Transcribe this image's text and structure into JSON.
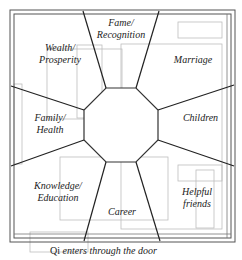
{
  "diagram": {
    "center_shape": "octagon",
    "areas": [
      {
        "id": "wealth",
        "label_line1": "Wealth/",
        "label_line2": "Prosperity"
      },
      {
        "id": "fame",
        "label_line1": "Fame/",
        "label_line2": "Recognition"
      },
      {
        "id": "marriage",
        "label_line1": "Marriage",
        "label_line2": ""
      },
      {
        "id": "family",
        "label_line1": "Family/",
        "label_line2": "Health"
      },
      {
        "id": "children",
        "label_line1": "Children",
        "label_line2": ""
      },
      {
        "id": "knowledge",
        "label_line1": "Knowledge/",
        "label_line2": "Education"
      },
      {
        "id": "career",
        "label_line1": "Career",
        "label_line2": ""
      },
      {
        "id": "helpful",
        "label_line1": "Helpful",
        "label_line2": "friends"
      }
    ],
    "caption": {
      "prefix": "Qi ",
      "rest": "enters through the door"
    },
    "colors": {
      "lines": "#333333",
      "floorplan": "#bbbbbb",
      "text": "#222222"
    }
  }
}
